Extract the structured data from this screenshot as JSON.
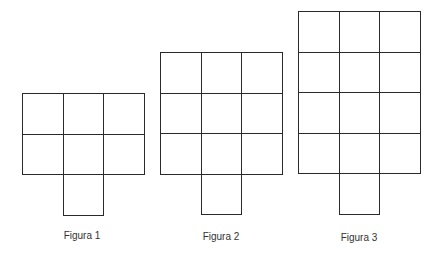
{
  "figures": [
    {
      "label": "Figura 1",
      "cols": 3,
      "rows": 2,
      "left": 22,
      "top": 93,
      "labelX": 42,
      "labelY": 230
    },
    {
      "label": "Figura 2",
      "cols": 3,
      "rows": 3,
      "left": 160,
      "top": 52,
      "labelX": 181,
      "labelY": 231
    },
    {
      "label": "Figura 3",
      "cols": 3,
      "rows": 4,
      "left": 298,
      "top": 11,
      "labelX": 319,
      "labelY": 232
    }
  ],
  "cell_size": 41,
  "tab": {
    "column_index": 1,
    "description": "one extra square below middle column"
  }
}
